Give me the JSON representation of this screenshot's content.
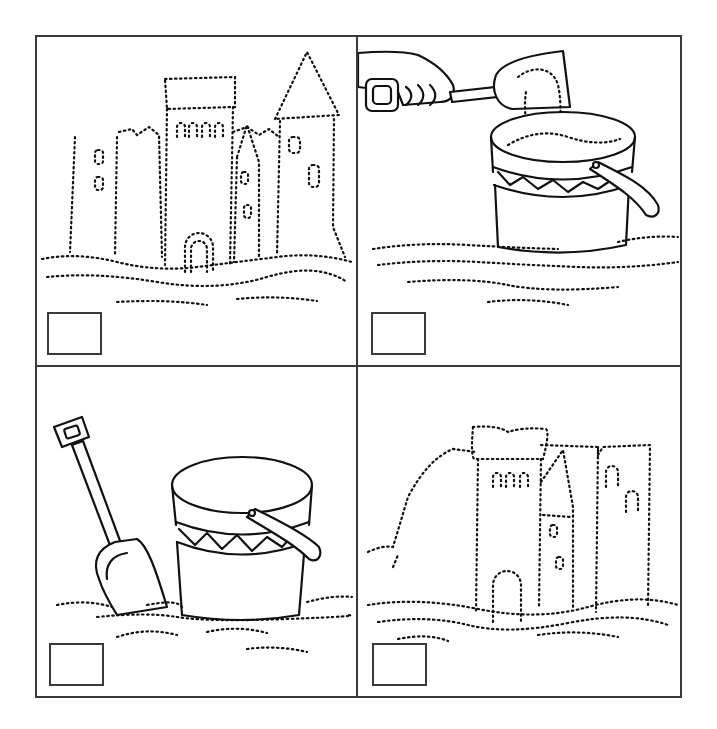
{
  "worksheet": {
    "type": "picture-sequencing",
    "panels": [
      {
        "id": "top-left",
        "scene": "completed sandcastle with towers",
        "answer_value": ""
      },
      {
        "id": "top-right",
        "scene": "hand with spade filling bucket with sand",
        "answer_value": ""
      },
      {
        "id": "bottom-left",
        "scene": "empty bucket and spade in sand",
        "answer_value": ""
      },
      {
        "id": "bottom-right",
        "scene": "partially built sandcastle",
        "answer_value": ""
      }
    ],
    "colors": {
      "line": "#111111",
      "border": "#3a3a3a",
      "background": "#ffffff"
    }
  }
}
